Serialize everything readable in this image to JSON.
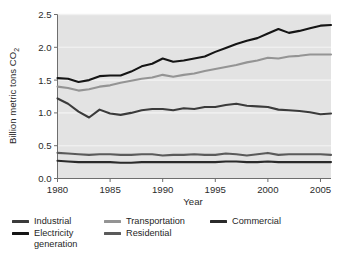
{
  "chart_data": {
    "type": "line",
    "title": "",
    "xlabel": "Year",
    "ylabel": "Billion metric tons CO2",
    "ylabel_display": "Billion metric tons CO",
    "ylabel_subscript": "2",
    "xlim": [
      1980,
      2006
    ],
    "ylim": [
      0.0,
      2.5
    ],
    "xticks": [
      1980,
      1985,
      1990,
      1995,
      2000,
      2005
    ],
    "xtick_labels": [
      "1980",
      "1985",
      "1990",
      "1995",
      "2000",
      "2005"
    ],
    "yticks": [
      0.0,
      0.5,
      1.0,
      1.5,
      2.0,
      2.5
    ],
    "ytick_labels": [
      "0.0",
      "0.5",
      "1.0",
      "1.5",
      "2.0",
      "2.5"
    ],
    "grid": "horizontal-faint-white",
    "plot_background": "#e3e3e3",
    "legend_position": "below-plot",
    "x": [
      1980,
      1981,
      1982,
      1983,
      1984,
      1985,
      1986,
      1987,
      1988,
      1989,
      1990,
      1991,
      1992,
      1993,
      1994,
      1995,
      1996,
      1997,
      1998,
      1999,
      2000,
      2001,
      2002,
      2003,
      2004,
      2005,
      2006
    ],
    "series": [
      {
        "name": "Electricity generation",
        "color": "#151515",
        "values": [
          1.53,
          1.52,
          1.47,
          1.5,
          1.56,
          1.57,
          1.57,
          1.63,
          1.71,
          1.75,
          1.83,
          1.78,
          1.8,
          1.83,
          1.86,
          1.93,
          1.99,
          2.05,
          2.1,
          2.14,
          2.21,
          2.28,
          2.22,
          2.25,
          2.29,
          2.33,
          2.34
        ]
      },
      {
        "name": "Transportation",
        "color": "#949494",
        "values": [
          1.4,
          1.38,
          1.34,
          1.36,
          1.4,
          1.42,
          1.46,
          1.49,
          1.52,
          1.54,
          1.58,
          1.55,
          1.58,
          1.6,
          1.64,
          1.67,
          1.7,
          1.73,
          1.77,
          1.8,
          1.84,
          1.83,
          1.86,
          1.87,
          1.89,
          1.89,
          1.89
        ]
      },
      {
        "name": "Industrial",
        "color": "#3b3b3b",
        "values": [
          1.22,
          1.14,
          1.02,
          0.93,
          1.05,
          0.99,
          0.97,
          1.0,
          1.04,
          1.06,
          1.06,
          1.04,
          1.07,
          1.06,
          1.09,
          1.09,
          1.12,
          1.14,
          1.11,
          1.1,
          1.09,
          1.05,
          1.04,
          1.03,
          1.01,
          0.98,
          0.99
        ]
      },
      {
        "name": "Residential",
        "color": "#5a5a5a",
        "values": [
          0.39,
          0.38,
          0.37,
          0.36,
          0.37,
          0.37,
          0.36,
          0.36,
          0.37,
          0.37,
          0.35,
          0.36,
          0.36,
          0.37,
          0.36,
          0.36,
          0.38,
          0.37,
          0.35,
          0.37,
          0.39,
          0.36,
          0.37,
          0.37,
          0.37,
          0.37,
          0.36
        ]
      },
      {
        "name": "Commercial",
        "color": "#2a2a2a",
        "values": [
          0.27,
          0.26,
          0.25,
          0.25,
          0.25,
          0.25,
          0.24,
          0.24,
          0.25,
          0.25,
          0.25,
          0.25,
          0.25,
          0.25,
          0.25,
          0.25,
          0.26,
          0.26,
          0.25,
          0.25,
          0.26,
          0.25,
          0.25,
          0.25,
          0.25,
          0.25,
          0.25
        ]
      }
    ]
  },
  "axes": {
    "x_title": "Year",
    "y_title_main": "Billion metric tons CO",
    "y_title_sub": "2"
  },
  "legend": {
    "items": [
      {
        "label": "Industrial",
        "color": "#3b3b3b"
      },
      {
        "label": "Transportation",
        "color": "#949494"
      },
      {
        "label": "Commercial",
        "color": "#2a2a2a"
      },
      {
        "label": "Electricity generation",
        "color": "#151515"
      },
      {
        "label": "Residential",
        "color": "#5a5a5a"
      }
    ]
  }
}
